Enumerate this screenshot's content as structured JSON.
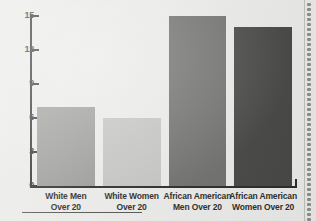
{
  "chart_data": {
    "type": "bar",
    "title": "",
    "subtitle": "",
    "xlabel": "",
    "ylabel": "",
    "categories": [
      "White Men Over 20",
      "White Women Over 20",
      "African American Men Over 20",
      "African American Women Over 20"
    ],
    "category_lines": [
      [
        "White Men",
        "Over 20"
      ],
      [
        "White Women",
        "Over 20"
      ],
      [
        "African American",
        "Men Over 20"
      ],
      [
        "African American",
        "Women Over 20"
      ]
    ],
    "values": [
      7,
      6,
      15,
      14
    ],
    "ylim": [
      0,
      15
    ],
    "yticks": [
      0,
      3,
      6,
      9,
      12,
      15
    ],
    "ytick_labels": [
      "0",
      "3",
      "6",
      "9",
      "12",
      "15"
    ],
    "grid": false,
    "legend": null,
    "bar_colors": [
      "#9a9a98",
      "#c3c3c1",
      "#6f6f6e",
      "#474746"
    ],
    "axis_color": "#2b2b2b",
    "background_color": "#e9e9e7",
    "text_color": "#2e2d2a"
  },
  "page": {
    "background_color": "#e9e9e7",
    "binding_icon": "spiral-binding-holes",
    "footer_rule": true
  }
}
